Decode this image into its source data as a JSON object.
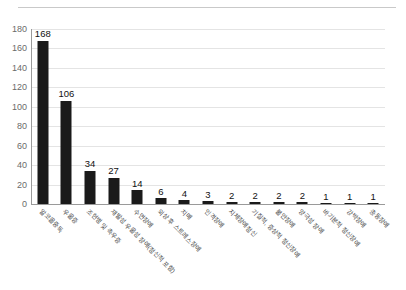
{
  "chart_data": {
    "type": "bar",
    "title": "",
    "subtitle": "",
    "xlabel": "",
    "ylabel": "",
    "ylim": [
      0,
      180
    ],
    "ytick_step": 20,
    "yticks": [
      0,
      20,
      40,
      60,
      80,
      100,
      120,
      140,
      160,
      180
    ],
    "grid": true,
    "grid_axis": "y",
    "legend": false,
    "legend_position": "none",
    "bar_color": "#1a1a1a",
    "gridline_color": "#e4e4e4",
    "axis_color": "#9a9a9a",
    "value_label_color": "#111111",
    "tick_label_color": "#6b6b6b",
    "xlabel_rotation_deg": 45,
    "categories": [
      "알코올중독",
      "우울증",
      "조현병 및 측우증",
      "재발성 우울성 장애(정신적 포함)",
      "수면장애",
      "외상 후 스트레스장애",
      "치매",
      "인격장애",
      "지체장애정신",
      "기질적, 증상적 정신장애",
      "불안장애",
      "양극성 장애",
      "바기분적 정신장애",
      "강박장애",
      "충동장애"
    ],
    "values": [
      168,
      106,
      34,
      27,
      14,
      6,
      4,
      3,
      2,
      2,
      2,
      2,
      1,
      1,
      1
    ],
    "value_labels": [
      "168",
      "106",
      "34",
      "27",
      "14",
      "6",
      "4",
      "3",
      "2",
      "2",
      "2",
      "2",
      "1",
      "1",
      "1"
    ]
  }
}
